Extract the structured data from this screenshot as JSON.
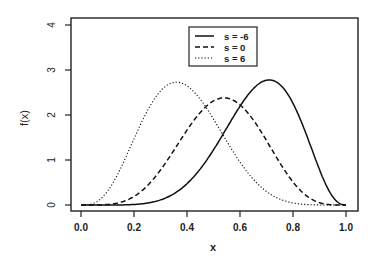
{
  "chart_data": {
    "type": "line",
    "title": "",
    "xlabel": "x",
    "ylabel": "f(x)",
    "xlim": [
      0.0,
      1.0
    ],
    "ylim": [
      0,
      4
    ],
    "x_ticks": [
      "0.0",
      "0.2",
      "0.4",
      "0.6",
      "0.8",
      "1.0"
    ],
    "y_ticks": [
      "0",
      "1",
      "2",
      "3",
      "4"
    ],
    "grid": false,
    "legend_position": "top-center",
    "x": [
      0.0,
      0.1,
      0.2,
      0.3,
      0.4,
      0.5,
      0.6,
      0.7,
      0.8,
      0.9,
      1.0
    ],
    "series": [
      {
        "name": "s = -6",
        "style": "solid",
        "mode": 0.71,
        "peak": 2.78,
        "values": [
          0.0,
          0.0,
          0.05,
          0.25,
          0.7,
          1.45,
          2.3,
          2.77,
          2.35,
          0.95,
          0.0
        ]
      },
      {
        "name": "s = 0",
        "style": "dashed",
        "mode": 0.54,
        "peak": 2.38,
        "values": [
          0.0,
          0.05,
          0.4,
          1.2,
          2.05,
          2.37,
          2.2,
          1.55,
          0.75,
          0.15,
          0.0
        ]
      },
      {
        "name": "s = 6",
        "style": "dotted",
        "mode": 0.36,
        "peak": 2.73,
        "values": [
          0.0,
          0.2,
          1.2,
          2.45,
          2.65,
          2.1,
          1.3,
          0.65,
          0.25,
          0.05,
          0.0
        ]
      }
    ]
  }
}
